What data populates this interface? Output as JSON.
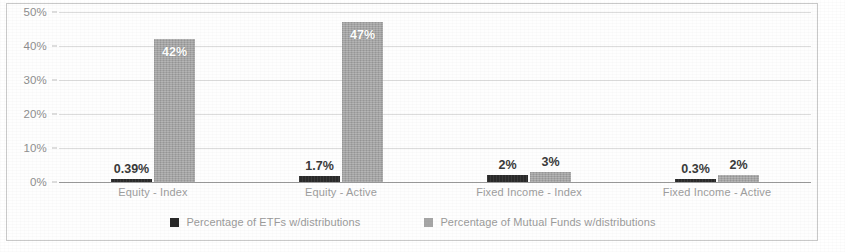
{
  "chart_data": {
    "type": "bar",
    "title": "",
    "subtitle": "",
    "xlabel": "",
    "ylabel": "",
    "ylim": [
      0,
      50
    ],
    "ytick_labels": [
      "0%",
      "10%",
      "20%",
      "30%",
      "40%",
      "50%"
    ],
    "ytick_values": [
      0,
      10,
      20,
      30,
      40,
      50
    ],
    "grid": true,
    "legend_position": "bottom",
    "categories": [
      "Equity - Index",
      "Equity - Active",
      "Fixed Income - Index",
      "Fixed Income - Active"
    ],
    "series": [
      {
        "name": "Percentage of ETFs w/distributions",
        "color": "#2a2a2a",
        "values": [
          0.39,
          1.7,
          2,
          0.3
        ],
        "labels": [
          "0.39%",
          "1.7%",
          "2%",
          "0.3%"
        ]
      },
      {
        "name": "Percentage of Mutual Funds w/distributions",
        "color": "#a6a6a6",
        "values": [
          42,
          47,
          3,
          2
        ],
        "labels": [
          "42%",
          "47%",
          "3%",
          "2%"
        ]
      }
    ]
  },
  "legend": {
    "items": [
      {
        "label": "Percentage of ETFs w/distributions",
        "swatch": "etf"
      },
      {
        "label": "Percentage of Mutual Funds w/distributions",
        "swatch": "mf"
      }
    ]
  }
}
